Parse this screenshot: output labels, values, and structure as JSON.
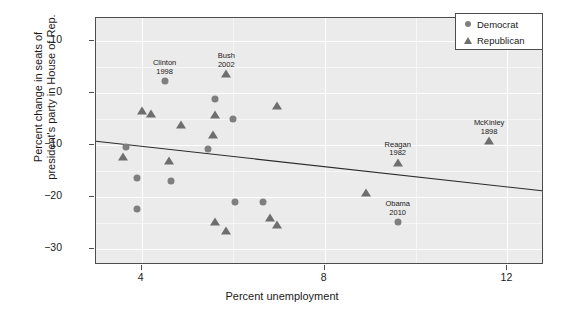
{
  "chart_data": {
    "type": "scatter",
    "title": "",
    "xlabel": "Percent unemployment",
    "ylabel": "Percent change in seats of president's party in House of Rep.",
    "xlim": [
      3.0,
      12.8
    ],
    "ylim": [
      -33.0,
      14.5
    ],
    "xticks": [
      4,
      8,
      12
    ],
    "xtick_labels": [
      "4",
      "8",
      "12"
    ],
    "yticks": [
      10,
      0,
      -10,
      -20,
      -30
    ],
    "ytick_labels": [
      "10",
      "0",
      "−10",
      "−20",
      "−30"
    ],
    "grid": true,
    "legend_position": "top-right",
    "panel_background": "#ebebeb",
    "grid_color": "#ffffff",
    "marker_color": "#7f7f7f",
    "axis_color": "#4d4d4d",
    "series": [
      {
        "name": "Democrat",
        "marker": "circle",
        "color": "#7f7f7f",
        "points": [
          {
            "x": 4.5,
            "y": 2.3,
            "label": "Clinton",
            "year": "1998"
          },
          {
            "x": 5.6,
            "y": -1.0,
            "label": "",
            "year": ""
          },
          {
            "x": 6.0,
            "y": -5.0,
            "label": "",
            "year": ""
          },
          {
            "x": 3.65,
            "y": -10.3,
            "label": "",
            "year": ""
          },
          {
            "x": 5.45,
            "y": -10.7,
            "label": "",
            "year": ""
          },
          {
            "x": 3.9,
            "y": -16.3,
            "label": "",
            "year": ""
          },
          {
            "x": 4.65,
            "y": -16.9,
            "label": "",
            "year": ""
          },
          {
            "x": 6.05,
            "y": -20.9,
            "label": "",
            "year": ""
          },
          {
            "x": 6.65,
            "y": -20.9,
            "label": "",
            "year": ""
          },
          {
            "x": 3.9,
            "y": -22.2,
            "label": "",
            "year": ""
          },
          {
            "x": 9.6,
            "y": -24.8,
            "label": "Obama",
            "year": "2010"
          }
        ]
      },
      {
        "name": "Republican",
        "marker": "triangle",
        "color": "#6e6e6e",
        "points": [
          {
            "x": 5.85,
            "y": 3.7,
            "label": "Bush",
            "year": "2002"
          },
          {
            "x": 6.95,
            "y": -2.5,
            "label": "",
            "year": ""
          },
          {
            "x": 4.0,
            "y": -3.4,
            "label": "",
            "year": ""
          },
          {
            "x": 4.2,
            "y": -3.9,
            "label": "",
            "year": ""
          },
          {
            "x": 5.6,
            "y": -4.2,
            "label": "",
            "year": ""
          },
          {
            "x": 4.85,
            "y": -6.1,
            "label": "",
            "year": ""
          },
          {
            "x": 5.55,
            "y": -8.0,
            "label": "",
            "year": ""
          },
          {
            "x": 11.6,
            "y": -9.2,
            "label": "McKinley",
            "year": "1898"
          },
          {
            "x": 3.6,
            "y": -12.2,
            "label": "",
            "year": ""
          },
          {
            "x": 4.6,
            "y": -12.9,
            "label": "",
            "year": ""
          },
          {
            "x": 9.6,
            "y": -13.3,
            "label": "Reagan",
            "year": "1982"
          },
          {
            "x": 8.9,
            "y": -19.1,
            "label": "",
            "year": ""
          },
          {
            "x": 6.8,
            "y": -23.9,
            "label": "",
            "year": ""
          },
          {
            "x": 5.6,
            "y": -24.8,
            "label": "",
            "year": ""
          },
          {
            "x": 6.95,
            "y": -25.3,
            "label": "",
            "year": ""
          },
          {
            "x": 5.85,
            "y": -26.5,
            "label": "",
            "year": ""
          }
        ]
      }
    ],
    "fit_line": {
      "type": "linear",
      "x_start": 3.0,
      "y_start": -9.4,
      "x_end": 12.8,
      "y_end": -19.0,
      "color": "#2b2b2b"
    },
    "annotations": [
      {
        "text": "Clinton",
        "year": "1998",
        "x": 4.5,
        "y": 2.3
      },
      {
        "text": "Bush",
        "year": "2002",
        "x": 5.85,
        "y": 3.7
      },
      {
        "text": "McKinley",
        "year": "1898",
        "x": 11.6,
        "y": -9.2
      },
      {
        "text": "Reagan",
        "year": "1982",
        "x": 9.6,
        "y": -13.3
      },
      {
        "text": "Obama",
        "year": "2010",
        "x": 9.6,
        "y": -24.8
      }
    ]
  },
  "legend": {
    "items": [
      {
        "label": "Democrat",
        "marker": "circle"
      },
      {
        "label": "Republican",
        "marker": "triangle"
      }
    ]
  },
  "axes": {
    "x_title": "Percent unemployment",
    "y_title_line1": "Percent change in seats of",
    "y_title_line2": "president's party in House of Rep."
  }
}
